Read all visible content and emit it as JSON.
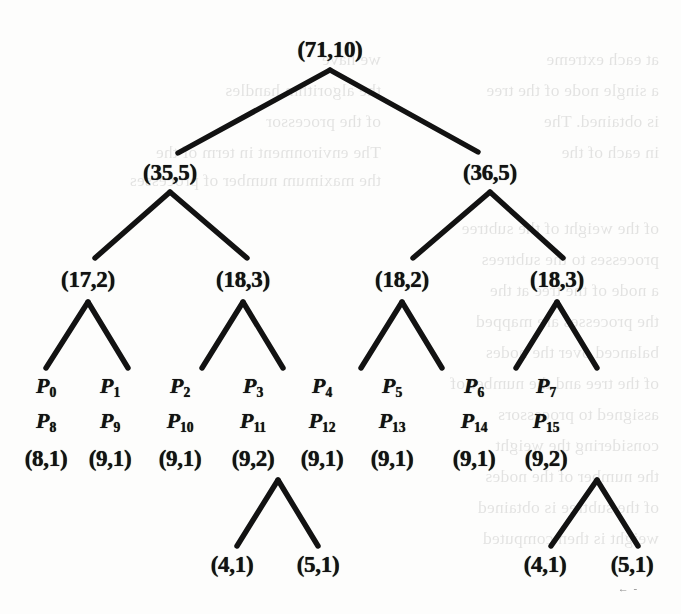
{
  "figure": {
    "type": "binary-tree",
    "ink_color": "#121212",
    "page_color": "#fdfdfc"
  },
  "tree": {
    "levels": [
      {
        "level": 0,
        "nodes": [
          {
            "id": "root",
            "label": "(71,10)",
            "x": 330,
            "y": 50
          }
        ]
      },
      {
        "level": 1,
        "nodes": [
          {
            "id": "n-l",
            "label": "(35,5)",
            "x": 170,
            "y": 173
          },
          {
            "id": "n-r",
            "label": "(36,5)",
            "x": 490,
            "y": 173
          }
        ]
      },
      {
        "level": 2,
        "nodes": [
          {
            "id": "n-ll",
            "label": "(17,2)",
            "x": 88,
            "y": 280
          },
          {
            "id": "n-lr",
            "label": "(18,3)",
            "x": 243,
            "y": 280
          },
          {
            "id": "n-rl",
            "label": "(18,2)",
            "x": 402,
            "y": 280
          },
          {
            "id": "n-rr",
            "label": "(18,3)",
            "x": 557,
            "y": 280
          }
        ]
      }
    ],
    "edges": [
      {
        "from": "root",
        "ax": 330,
        "ay": 70,
        "x1": 178,
        "y1": 153,
        "x2": 478,
        "y2": 152
      },
      {
        "from": "n-l",
        "ax": 170,
        "ay": 192,
        "x1": 95,
        "y1": 258,
        "x2": 247,
        "y2": 258
      },
      {
        "from": "n-r",
        "ax": 490,
        "ay": 192,
        "x1": 413,
        "y1": 258,
        "x2": 563,
        "y2": 258
      },
      {
        "from": "n-ll",
        "ax": 88,
        "ay": 302,
        "x1": 46,
        "y1": 368,
        "x2": 128,
        "y2": 368
      },
      {
        "from": "n-lr",
        "ax": 243,
        "ay": 302,
        "x1": 202,
        "y1": 368,
        "x2": 283,
        "y2": 368
      },
      {
        "from": "n-rl",
        "ax": 402,
        "ay": 302,
        "x1": 361,
        "y1": 368,
        "x2": 442,
        "y2": 368
      },
      {
        "from": "n-rr",
        "ax": 557,
        "ay": 302,
        "x1": 516,
        "y1": 368,
        "x2": 597,
        "y2": 368
      },
      {
        "from": "leaf-3",
        "ax": 278,
        "ay": 480,
        "x1": 237,
        "y1": 546,
        "x2": 318,
        "y2": 546
      },
      {
        "from": "leaf-7",
        "ax": 597,
        "ay": 480,
        "x1": 551,
        "y1": 546,
        "x2": 638,
        "y2": 546
      }
    ],
    "leaves": [
      {
        "index": 0,
        "x": 46,
        "top_name": "P",
        "top_sub": "0",
        "bottom_name": "P",
        "bottom_sub": "8",
        "weight": "(8,1)"
      },
      {
        "index": 1,
        "x": 110,
        "top_name": "P",
        "top_sub": "1",
        "bottom_name": "P",
        "bottom_sub": "9",
        "weight": "(9,1)"
      },
      {
        "index": 2,
        "x": 180,
        "top_name": "P",
        "top_sub": "2",
        "bottom_name": "P",
        "bottom_sub": "10",
        "weight": "(9,1)"
      },
      {
        "index": 3,
        "x": 253,
        "top_name": "P",
        "top_sub": "3",
        "bottom_name": "P",
        "bottom_sub": "11",
        "weight": "(9,2)"
      },
      {
        "index": 4,
        "x": 322,
        "top_name": "P",
        "top_sub": "4",
        "bottom_name": "P",
        "bottom_sub": "12",
        "weight": "(9,1)"
      },
      {
        "index": 5,
        "x": 392,
        "top_name": "P",
        "top_sub": "5",
        "bottom_name": "P",
        "bottom_sub": "13",
        "weight": "(9,1)"
      },
      {
        "index": 6,
        "x": 474,
        "top_name": "P",
        "top_sub": "6",
        "bottom_name": "P",
        "bottom_sub": "14",
        "weight": "(9,1)"
      },
      {
        "index": 7,
        "x": 546,
        "top_name": "P",
        "top_sub": "7",
        "bottom_name": "P",
        "bottom_sub": "15",
        "weight": "(9,2)"
      }
    ],
    "leaf_rows": {
      "name_row_y": 387,
      "name_row2_y": 422,
      "weight_row_y": 459
    },
    "bottom_nodes": [
      {
        "label": "(4,1)",
        "x": 232,
        "y": 565
      },
      {
        "label": "(5,1)",
        "x": 318,
        "y": 565
      },
      {
        "label": "(4,1)",
        "x": 545,
        "y": 565
      },
      {
        "label": "(5,1)",
        "x": 632,
        "y": 565
      }
    ],
    "smudge": {
      "text": "← -",
      "x": 628,
      "y": 588
    }
  },
  "background_text": {
    "note": "Faint mirrored show-through text from the reverse page; partially legible",
    "lines": [
      {
        "x": 22,
        "y": 44,
        "text": "at each extreme"
      },
      {
        "x": 22,
        "y": 75,
        "text": "a single node of the tree"
      },
      {
        "x": 22,
        "y": 106,
        "text": "is obtained. The"
      },
      {
        "x": 22,
        "y": 137,
        "text": "in each of the"
      },
      {
        "x": 300,
        "y": 44,
        "text": "we have"
      },
      {
        "x": 300,
        "y": 75,
        "text": "the algorithm handles"
      },
      {
        "x": 300,
        "y": 106,
        "text": "of the processor"
      },
      {
        "x": 300,
        "y": 137,
        "text": "The environment in term of the"
      },
      {
        "x": 300,
        "y": 165,
        "text": "the maximum number of processes"
      },
      {
        "x": 22,
        "y": 213,
        "text": "of the weight of the subtree"
      },
      {
        "x": 22,
        "y": 244,
        "text": "processes to the subtrees"
      },
      {
        "x": 22,
        "y": 275,
        "text": "a node of the tree at the"
      },
      {
        "x": 22,
        "y": 306,
        "text": "the processes are mapped"
      },
      {
        "x": 22,
        "y": 337,
        "text": "balanced over the nodes"
      },
      {
        "x": 22,
        "y": 368,
        "text": "of the tree and the number of"
      },
      {
        "x": 22,
        "y": 399,
        "text": "assigned to processors"
      },
      {
        "x": 22,
        "y": 430,
        "text": "considering the weight"
      },
      {
        "x": 22,
        "y": 461,
        "text": "the number of the nodes"
      },
      {
        "x": 22,
        "y": 492,
        "text": "of the subtree is obtained"
      },
      {
        "x": 22,
        "y": 523,
        "text": "weight is then computed"
      }
    ]
  }
}
